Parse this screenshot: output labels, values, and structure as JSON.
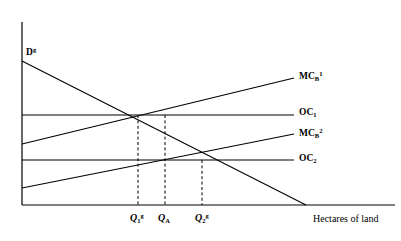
{
  "figure": {
    "background": "#ffffff",
    "line_color": "#000000",
    "axis": {
      "x_title": "Hectares of land",
      "origin": {
        "x": 22,
        "y": 205
      },
      "x_end": 395,
      "y_top": 22
    }
  },
  "labels": {
    "demand": {
      "base": "D",
      "sup": "g",
      "sub": "",
      "x": 26,
      "y": 47
    },
    "mc_b_1": {
      "base": "MC",
      "sub": "B",
      "sup": "1",
      "x": 299,
      "y": 71
    },
    "oc_1": {
      "base": "OC",
      "sub": "1",
      "sup": "",
      "x": 299,
      "y": 108
    },
    "mc_b_2": {
      "base": "MC",
      "sub": "B",
      "sup": "2",
      "x": 299,
      "y": 128
    },
    "oc_2": {
      "base": "OC",
      "sub": "2",
      "sup": "",
      "x": 299,
      "y": 154
    },
    "x_axis_title": {
      "text": "Hectares of land",
      "x": 313,
      "y": 214
    }
  },
  "x_ticks": [
    {
      "base": "Q",
      "sub": "1",
      "sup": "g",
      "x": 130,
      "y": 213,
      "line_x": 138
    },
    {
      "base": "Q",
      "sub": "A",
      "sup": "",
      "x": 158,
      "y": 213,
      "line_x": 165
    },
    {
      "base": "Q",
      "sub": "2",
      "sup": "g",
      "x": 195,
      "y": 213,
      "line_x": 202
    }
  ],
  "chart_data": {
    "type": "line",
    "title": "",
    "xlabel": "Hectares of land",
    "ylabel": "",
    "grid": false,
    "legend": "inline-right-labels",
    "axis_pixels": {
      "x0": 22,
      "y0": 205,
      "x1": 395,
      "y_top": 22
    },
    "series": [
      {
        "name": "D^g",
        "label": "D",
        "label_sup": "g",
        "description": "Downward sloping demand for land (government/public demand)",
        "points": [
          [
            22,
            61
          ],
          [
            306,
            205
          ]
        ],
        "dash": false
      },
      {
        "name": "OC_1",
        "label": "OC",
        "label_sub": "1",
        "description": "Horizontal opportunity cost line, upper level",
        "points": [
          [
            22,
            115
          ],
          [
            294,
            115
          ]
        ],
        "dash": false
      },
      {
        "name": "OC_2",
        "label": "OC",
        "label_sub": "2",
        "description": "Horizontal opportunity cost line, lower level",
        "points": [
          [
            22,
            160
          ],
          [
            294,
            160
          ]
        ],
        "dash": false
      },
      {
        "name": "MC_B^1",
        "label": "MC",
        "label_sub": "B",
        "label_sup": "1",
        "description": "Upward sloping marginal cost of bureaucracy, schedule 1",
        "points": [
          [
            22,
            144
          ],
          [
            294,
            78
          ]
        ],
        "dash": false
      },
      {
        "name": "MC_B^2",
        "label": "MC",
        "label_sub": "B",
        "label_sup": "2",
        "description": "Upward sloping marginal cost of bureaucracy, schedule 2",
        "points": [
          [
            22,
            188
          ],
          [
            294,
            134
          ]
        ],
        "dash": false
      }
    ],
    "dropline_ticks": [
      {
        "name": "Q_1^g",
        "x": 138,
        "y_from": 115,
        "y_to": 205
      },
      {
        "name": "Q_A",
        "x": 165,
        "y_from": 115,
        "y_to": 205
      },
      {
        "name": "Q_2^g",
        "x": 202,
        "y_from": 160,
        "y_to": 205
      }
    ],
    "intersections": [
      {
        "name": "Q_1^g",
        "of": [
          "D^g",
          "MC_B^1"
        ],
        "x": 138,
        "y": 115
      },
      {
        "name": "Q_A",
        "of": [
          "D^g",
          "OC_1"
        ],
        "x": 165,
        "y": 115
      },
      {
        "name": "Q_2^g",
        "of": [
          "D^g",
          "MC_B^2"
        ],
        "x": 202,
        "y": 160
      }
    ]
  }
}
